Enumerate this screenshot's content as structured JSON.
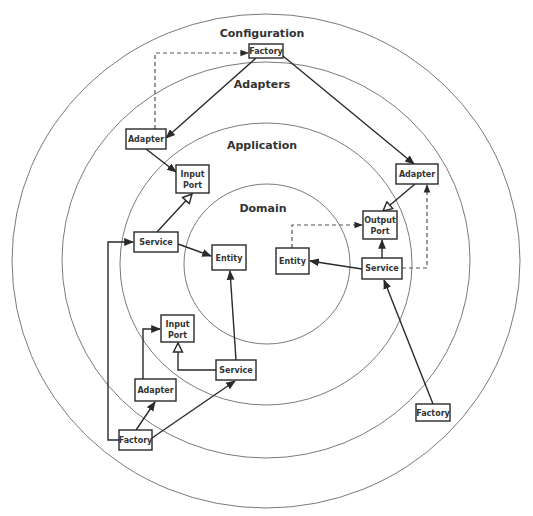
{
  "diagram": {
    "type": "hexagonal-architecture-concentric-layers",
    "layers": [
      {
        "label": "Configuration",
        "rx": 254,
        "ry": 247
      },
      {
        "label": "Adapters",
        "rx": 204,
        "ry": 198
      },
      {
        "label": "Application",
        "rx": 146,
        "ry": 141
      },
      {
        "label": "Domain",
        "rx": 83,
        "ry": 80
      }
    ],
    "nodes": {
      "factory_top": {
        "line1": "Factory"
      },
      "adapter_left": {
        "line1": "Adapter"
      },
      "input_port_top": {
        "line1": "Input",
        "line2": "Port"
      },
      "adapter_right": {
        "line1": "Adapter"
      },
      "output_port": {
        "line1": "Output",
        "line2": "Port"
      },
      "service_left": {
        "line1": "Service"
      },
      "entity_left": {
        "line1": "Entity"
      },
      "entity_right": {
        "line1": "Entity"
      },
      "service_right": {
        "line1": "Service"
      },
      "input_port_bottom": {
        "line1": "Input",
        "line2": "Port"
      },
      "adapter_bottom": {
        "line1": "Adapter"
      },
      "service_bottom": {
        "line1": "Service"
      },
      "factory_bottom": {
        "line1": "Factory"
      },
      "factory_right": {
        "line1": "Factory"
      }
    },
    "edges": [
      {
        "from": "factory_top",
        "to": "adapter_left",
        "style": "solid-arrow"
      },
      {
        "from": "factory_top",
        "to": "adapter_right",
        "style": "solid-arrow"
      },
      {
        "from": "adapter_left",
        "to": "factory_top",
        "style": "dashed-arrow"
      },
      {
        "from": "adapter_left",
        "to": "input_port_top",
        "style": "solid-arrow"
      },
      {
        "from": "service_left",
        "to": "input_port_top",
        "style": "realization"
      },
      {
        "from": "service_left",
        "to": "entity_left",
        "style": "solid-arrow"
      },
      {
        "from": "adapter_right",
        "to": "output_port",
        "style": "realization"
      },
      {
        "from": "entity_right",
        "to": "output_port",
        "style": "dashed-arrow"
      },
      {
        "from": "service_right",
        "to": "output_port",
        "style": "solid-arrow"
      },
      {
        "from": "service_right",
        "to": "entity_right",
        "style": "solid-arrow"
      },
      {
        "from": "service_right",
        "to": "adapter_right",
        "style": "dashed-arrow"
      },
      {
        "from": "factory_right",
        "to": "service_right",
        "style": "solid-arrow"
      },
      {
        "from": "factory_bottom",
        "to": "service_left",
        "style": "solid-arrow"
      },
      {
        "from": "factory_bottom",
        "to": "adapter_bottom",
        "style": "solid-arrow"
      },
      {
        "from": "factory_bottom",
        "to": "service_bottom",
        "style": "solid-arrow"
      },
      {
        "from": "adapter_bottom",
        "to": "input_port_bottom",
        "style": "solid-arrow"
      },
      {
        "from": "service_bottom",
        "to": "input_port_bottom",
        "style": "realization"
      },
      {
        "from": "service_bottom",
        "to": "entity_left",
        "style": "solid-arrow"
      }
    ]
  }
}
